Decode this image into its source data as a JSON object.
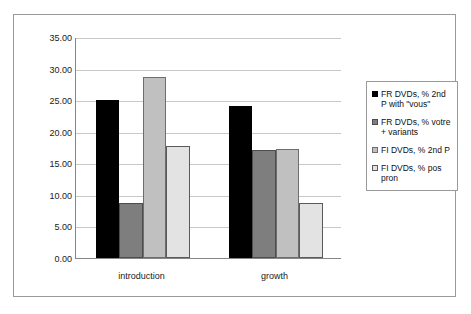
{
  "chart_data": {
    "type": "bar",
    "title": "",
    "xlabel": "",
    "ylabel": "",
    "categories": [
      "introduction",
      "growth"
    ],
    "ylim": [
      0,
      35
    ],
    "ytick_values": [
      35,
      30,
      25,
      20,
      15,
      10,
      5,
      0
    ],
    "ytick_labels": [
      "35.00",
      "30.00",
      "25.00",
      "20.00",
      "15.00",
      "10.00",
      "5.00",
      "0.00"
    ],
    "grid": true,
    "legend_position": "right",
    "series": [
      {
        "name": "FR DVDs, % 2nd P with \"vous\"",
        "color": "#000000",
        "values": [
          25.0,
          24.1
        ]
      },
      {
        "name": "FR DVDs, % votre + variants",
        "color": "#7e7e7e",
        "values": [
          8.7,
          17.1
        ]
      },
      {
        "name": "FI DVDs, % 2nd P",
        "color": "#c0c0c0",
        "values": [
          28.7,
          17.3
        ]
      },
      {
        "name": "FI DVDs, % pos pron",
        "color": "#e3e3e3",
        "values": [
          17.8,
          8.7
        ]
      }
    ]
  },
  "legend": {
    "entries": [
      {
        "label": "FR DVDs, % 2nd P with \"vous\"",
        "swatch": "#000000",
        "border": "#000000"
      },
      {
        "label": "FR DVDs, % votre + variants",
        "swatch": "#7e7e7e",
        "border": "#4d4d4d"
      },
      {
        "label": "FI DVDs, % 2nd P",
        "swatch": "#c0c0c0",
        "border": "#6d6d6d"
      },
      {
        "label": "FI DVDs, % pos pron",
        "swatch": "#e3e3e3",
        "border": "#5a5a5a"
      }
    ]
  },
  "colors": {
    "frame_border": "#9a9a9a",
    "axis_line": "#868686",
    "gridline": "#c8c8c8",
    "background": "#ffffff",
    "text": "#1a1a1a"
  }
}
